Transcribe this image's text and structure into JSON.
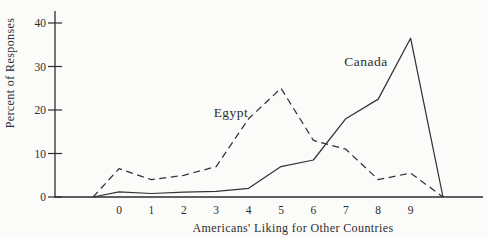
{
  "colors": {
    "ink": "#2e2e2e",
    "background": "#fbfbf9"
  },
  "chart_data": {
    "type": "line",
    "title": "",
    "xlabel": "Americans' Liking for Other Countries",
    "ylabel": "Percent of Responses",
    "xticks": [
      0,
      1,
      2,
      3,
      4,
      5,
      6,
      7,
      8,
      9
    ],
    "yticks": [
      0,
      10,
      20,
      30,
      40
    ],
    "xlim": [
      -2,
      11.4
    ],
    "ylim": [
      0,
      42.5
    ],
    "grid": false,
    "legend_position": "inline-labels-near-lines",
    "series": [
      {
        "name": "Egypt",
        "style": "dashed",
        "points": [
          [
            -0.8,
            0
          ],
          [
            0,
            6.5
          ],
          [
            1,
            4
          ],
          [
            2,
            5
          ],
          [
            3,
            7
          ],
          [
            4,
            18
          ],
          [
            5,
            25
          ],
          [
            6,
            13
          ],
          [
            7,
            11
          ],
          [
            8,
            4
          ],
          [
            9,
            5.5
          ],
          [
            10,
            0
          ]
        ]
      },
      {
        "name": "Canada",
        "style": "solid",
        "points": [
          [
            -0.8,
            0
          ],
          [
            0,
            1.2
          ],
          [
            1,
            0.8
          ],
          [
            2,
            1.1
          ],
          [
            3,
            1.3
          ],
          [
            4,
            2
          ],
          [
            5,
            7
          ],
          [
            6,
            8.5
          ],
          [
            7,
            18
          ],
          [
            8,
            22.5
          ],
          [
            9,
            36.5
          ],
          [
            10,
            0
          ]
        ]
      }
    ]
  }
}
